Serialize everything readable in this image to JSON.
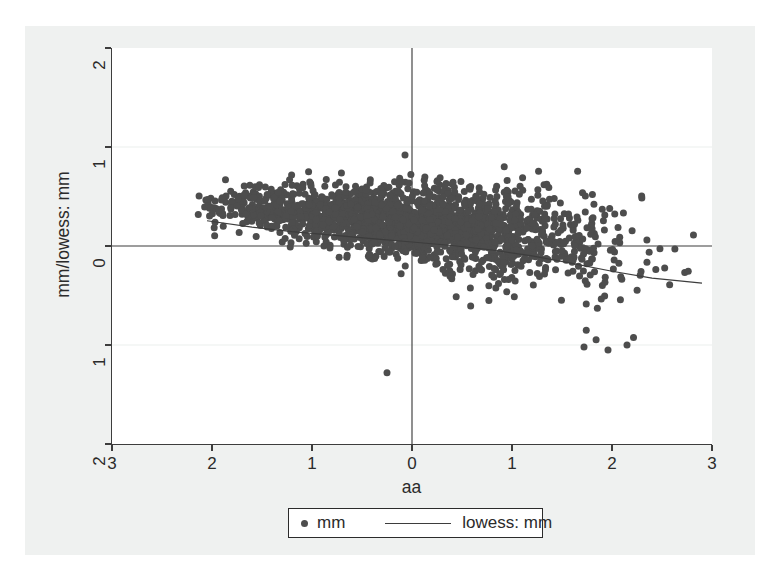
{
  "figure": {
    "background_color": "#eff1f0",
    "plot_background_color": "#ffffff"
  },
  "axes": {
    "y": {
      "title": "mm/lowess: mm",
      "ticks": [
        {
          "label": "2",
          "value": 2
        },
        {
          "label": "1",
          "value": 1
        },
        {
          "label": "0",
          "value": 0
        },
        {
          "label": "1",
          "value": -1
        },
        {
          "label": "2",
          "value": -2
        }
      ],
      "range": [
        -2,
        2
      ]
    },
    "x": {
      "title": "aa",
      "ticks": [
        {
          "label": "3",
          "value": -3
        },
        {
          "label": "2",
          "value": -2
        },
        {
          "label": "1",
          "value": -1
        },
        {
          "label": "0",
          "value": 0
        },
        {
          "label": "1",
          "value": 1
        },
        {
          "label": "2",
          "value": 2
        },
        {
          "label": "3",
          "value": 3
        }
      ],
      "range": [
        -3,
        3
      ]
    }
  },
  "legend": {
    "entries": [
      {
        "kind": "marker",
        "label": "mm"
      },
      {
        "kind": "line",
        "label": "lowess: mm"
      }
    ]
  },
  "chart_data": {
    "type": "scatter",
    "title": "",
    "xlabel": "aa",
    "ylabel": "mm/lowess: mm",
    "xlim": [
      -3,
      3
    ],
    "ylim": [
      -2,
      2
    ],
    "grid": "faint horizontal gridlines at y = 1 and y = -1",
    "legend_position": "below-plot-center",
    "marker_color": "#4d4d4d",
    "marker_size_px": 7,
    "line_color": "#3d3d3d",
    "reference_lines": [
      {
        "name": "zero-horizontal",
        "orientation": "horizontal",
        "value": 0
      },
      {
        "name": "zero-vertical",
        "orientation": "vertical",
        "value": 0
      }
    ],
    "series": [
      {
        "name": "mm",
        "kind": "scatter",
        "n_points": 2000,
        "description": "Residual cloud versus aa; heteroskedastic fan widening to the right, centred slightly below zero at high aa.",
        "x_observed_range": [
          -2.15,
          2.95
        ],
        "y_observed_range": [
          -1.28,
          0.92
        ],
        "distribution_hint": {
          "x_mean": 0.0,
          "x_sd": 0.95,
          "y_mean_at_x": "0.24 - 0.105*x - 0.012*x^2",
          "y_sd_at_x": "0.14 + 0.075*(x + 2.2)"
        },
        "notable_points": [
          {
            "x": -0.25,
            "y": -1.28,
            "note": "low outlier below cluster"
          },
          {
            "x": -0.07,
            "y": 0.92,
            "note": "high outlier above cluster"
          },
          {
            "x": 1.72,
            "y": -1.02,
            "note": "lower-right outlier"
          },
          {
            "x": 1.96,
            "y": -1.05,
            "note": "lower-right outlier"
          },
          {
            "x": 2.15,
            "y": -1.0,
            "note": "lower-right outlier"
          }
        ]
      },
      {
        "name": "lowess: mm",
        "kind": "line",
        "description": "Lowess smoother of mm on aa, descending monotonically left to right.",
        "x": [
          -2.05,
          -1.6,
          -1.2,
          -0.8,
          -0.4,
          0.0,
          0.4,
          0.8,
          1.2,
          1.6,
          2.0,
          2.4,
          2.9
        ],
        "y": [
          0.255,
          0.19,
          0.145,
          0.11,
          0.075,
          0.04,
          0.005,
          -0.04,
          -0.1,
          -0.175,
          -0.255,
          -0.325,
          -0.375
        ]
      }
    ]
  }
}
